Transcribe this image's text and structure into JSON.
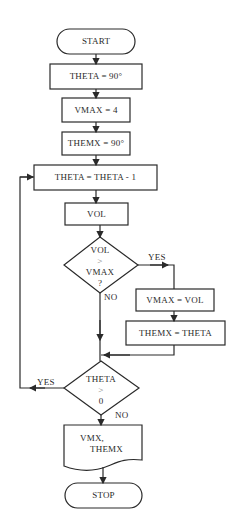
{
  "flowchart": {
    "start": "START",
    "init_theta": "THETA = 90°",
    "init_vmax": "VMAX = 4",
    "init_themx": "THEMX = 90°",
    "decrement": "THETA = THETA - 1",
    "compute_vol": "VOL",
    "decision1": {
      "line1": "VOL",
      "line2": ">",
      "line3": "VMAX",
      "line4": "?"
    },
    "decision1_yes": "YES",
    "decision1_no": "NO",
    "set_vmax": "VMAX = VOL",
    "set_themx": "THEMX = THETA",
    "decision2": {
      "line1": "THETA",
      "line2": ">",
      "line3": "0"
    },
    "decision2_yes": "YES",
    "decision2_no": "NO",
    "output": {
      "line1": "VMX,",
      "line2": "THEMX"
    },
    "stop": "STOP"
  },
  "colors": {
    "stroke": "#2a2a2a",
    "background": "#ffffff"
  }
}
